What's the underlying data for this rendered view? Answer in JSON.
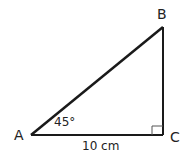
{
  "diagram": {
    "type": "right-triangle",
    "vertices": {
      "A": {
        "label": "A",
        "x": 31,
        "y": 135
      },
      "B": {
        "label": "B",
        "x": 163,
        "y": 27
      },
      "C": {
        "label": "C",
        "x": 163,
        "y": 135
      }
    },
    "angle_A": "45°",
    "side_AC": "10 cm",
    "right_angle_at": "C",
    "stroke_color": "#1a1a1a"
  }
}
